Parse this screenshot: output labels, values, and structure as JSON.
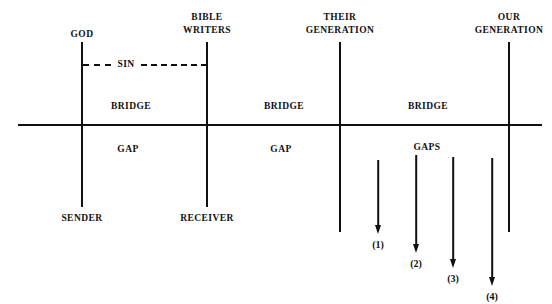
{
  "diagram": {
    "title_text": "",
    "ink_color": "#111111",
    "background_color": "#ffffff",
    "axis": {
      "horizontal_label": "",
      "x_start": 18,
      "x_end": 542,
      "y": 125
    },
    "columns": [
      {
        "id": "god",
        "top_label": "GOD",
        "top_label_lines": [
          "GOD"
        ],
        "bottom_label": "SENDER",
        "x": 82,
        "line_top": 42,
        "line_bottom": 207
      },
      {
        "id": "bible-writers",
        "top_label": "BIBLE WRITERS",
        "top_label_lines": [
          "BIBLE",
          "WRITERS"
        ],
        "bottom_label": "RECEIVER",
        "x": 207,
        "line_top": 42,
        "line_bottom": 207
      },
      {
        "id": "their-generation",
        "top_label": "THEIR GENERATION",
        "top_label_lines": [
          "THEIR",
          "GENERATION"
        ],
        "bottom_label": "",
        "x": 340,
        "line_top": 42,
        "line_bottom": 232
      },
      {
        "id": "our-generation",
        "top_label": "OUR GENERATION",
        "top_label_lines": [
          "OUR",
          "GENERATION"
        ],
        "bottom_label": "",
        "x": 509,
        "line_top": 42,
        "line_bottom": 232
      }
    ],
    "sin_line": {
      "label": "SIN",
      "x_start": 82,
      "x_end": 207,
      "y": 64,
      "style": "dashed"
    },
    "upper_region_labels": [
      {
        "id": "bridge-1",
        "text": "BRIDGE",
        "x": 131,
        "y": 100
      },
      {
        "id": "bridge-2",
        "text": "BRIDGE",
        "x": 284,
        "y": 100
      },
      {
        "id": "bridge-3",
        "text": "BRIDGE",
        "x": 428,
        "y": 100
      }
    ],
    "lower_region_labels": [
      {
        "id": "gap-1",
        "text": "GAP",
        "x": 128,
        "y": 143
      },
      {
        "id": "gap-2",
        "text": "GAP",
        "x": 281,
        "y": 143
      },
      {
        "id": "gaps-3",
        "text": "GAPS",
        "x": 427,
        "y": 141
      }
    ],
    "arrows": [
      {
        "id": "arrow-1",
        "label": "(1)",
        "x": 378,
        "y_top": 160,
        "y_tip": 234,
        "label_y": 239
      },
      {
        "id": "arrow-2",
        "label": "(2)",
        "x": 416,
        "y_top": 155,
        "y_tip": 253,
        "label_y": 258
      },
      {
        "id": "arrow-3",
        "label": "(3)",
        "x": 453,
        "y_top": 157,
        "y_tip": 268,
        "label_y": 273
      },
      {
        "id": "arrow-4",
        "label": "(4)",
        "x": 492,
        "y_top": 158,
        "y_tip": 286,
        "label_y": 291
      }
    ]
  }
}
